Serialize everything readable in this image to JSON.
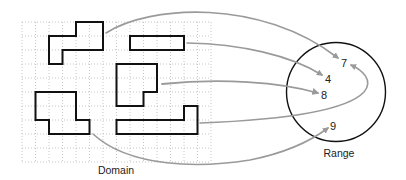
{
  "diagram": {
    "type": "function-mapping",
    "domain": {
      "label": "Domain",
      "grid": {
        "columns": 14,
        "rows": 10
      },
      "shapes": [
        {
          "id": "shape-a",
          "description": "L/Z-shaped polyomino, top-left"
        },
        {
          "id": "shape-b",
          "description": "horizontal 4x1 bar, top-middle"
        },
        {
          "id": "shape-c",
          "description": "L-shaped polyomino, center"
        },
        {
          "id": "shape-d",
          "description": "S/Z-shaped polyomino, bottom-left"
        },
        {
          "id": "shape-e",
          "description": "long bar with raised end, bottom-right"
        }
      ]
    },
    "range": {
      "label": "Range",
      "values": [
        "7",
        "4",
        "8",
        "9"
      ]
    },
    "mappings": [
      {
        "from": "shape-a",
        "to": "7"
      },
      {
        "from": "shape-b",
        "to": "4"
      },
      {
        "from": "shape-c",
        "to": "8"
      },
      {
        "from": "shape-e",
        "to": "7"
      },
      {
        "from": "shape-d",
        "to": "9"
      }
    ],
    "colors": {
      "shape_stroke": "#111111",
      "grid": "#b8b8b8",
      "arrow": "#9a9a9a",
      "circle": "#111111"
    }
  }
}
